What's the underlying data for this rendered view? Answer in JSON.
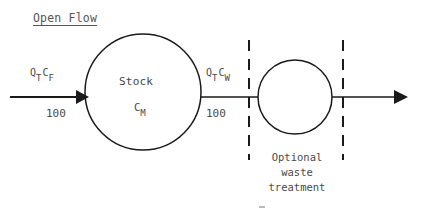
{
  "diagram": {
    "title": "Open Flow",
    "inflow": {
      "symbol_q": "Q",
      "symbol_q_sub": "T",
      "symbol_c": "C",
      "symbol_c_sub": "F",
      "value": "100"
    },
    "stock": {
      "label": "Stock",
      "symbol": "C",
      "symbol_sub": "M"
    },
    "outflow_to_treatment": {
      "symbol_q": "Q",
      "symbol_q_sub": "T",
      "symbol_c": "C",
      "symbol_c_sub": "W",
      "value": "100"
    },
    "treatment": {
      "caption_line1": "Optional",
      "caption_line2": "waste",
      "caption_line3": "treatment"
    },
    "colors": {
      "stroke": "#1a1a1a",
      "text": "#444444",
      "background": "#ffffff"
    }
  }
}
